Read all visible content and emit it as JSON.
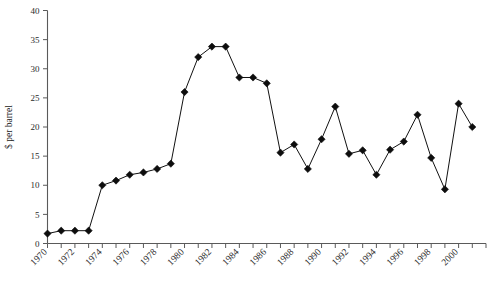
{
  "chart_data": {
    "type": "line",
    "title": "",
    "xlabel": "",
    "ylabel": "$ per barrel",
    "xlim": [
      1970,
      2002
    ],
    "ylim": [
      0,
      40
    ],
    "ytick_step": 5,
    "yticks": [
      0,
      5,
      10,
      15,
      20,
      25,
      30,
      35,
      40
    ],
    "ytick_labels": [
      "0",
      "5",
      "10",
      "15",
      "20",
      "25",
      "30",
      "35",
      "40"
    ],
    "xticks": [
      1970,
      1971,
      1972,
      1973,
      1974,
      1975,
      1976,
      1977,
      1978,
      1979,
      1980,
      1981,
      1982,
      1983,
      1984,
      1985,
      1986,
      1987,
      1988,
      1989,
      1990,
      1991,
      1992,
      1993,
      1994,
      1995,
      1996,
      1997,
      1998,
      1999,
      2000,
      2001,
      2002
    ],
    "xtick_labels_shown": [
      "1970",
      "1972",
      "1974",
      "1976",
      "1978",
      "1980",
      "1982",
      "1984",
      "1986",
      "1988",
      "1990",
      "1992",
      "1994",
      "1996",
      "1998",
      "2000"
    ],
    "xtick_label_interval": 2,
    "grid": false,
    "legend": false,
    "marker": "diamond",
    "line_color": "#111111",
    "marker_color": "#0d0d0d",
    "axis_color": "#5a5a5a",
    "x": [
      1970,
      1971,
      1972,
      1973,
      1974,
      1975,
      1976,
      1977,
      1978,
      1979,
      1980,
      1981,
      1982,
      1983,
      1984,
      1985,
      1986,
      1987,
      1988,
      1989,
      1990,
      1991,
      1992,
      1993,
      1994,
      1995,
      1996,
      1997,
      1998,
      1999,
      2000,
      2001
    ],
    "values": [
      1.7,
      2.2,
      2.2,
      2.2,
      10.0,
      10.8,
      11.8,
      12.2,
      12.8,
      13.7,
      26.0,
      32.0,
      33.8,
      33.8,
      28.5,
      28.5,
      27.5,
      15.6,
      17.0,
      12.8,
      17.9,
      23.5,
      15.4,
      16.0,
      11.8,
      16.1,
      17.5,
      22.1,
      14.7,
      9.3,
      24.0,
      20.0
    ],
    "series": [
      {
        "name": "Crude oil price",
        "values": [
          1.7,
          2.2,
          2.2,
          2.2,
          10.0,
          10.8,
          11.8,
          12.2,
          12.8,
          13.7,
          26.0,
          32.0,
          33.8,
          33.8,
          28.5,
          28.5,
          27.5,
          15.6,
          17.0,
          12.8,
          17.9,
          23.5,
          15.4,
          16.0,
          11.8,
          16.1,
          17.5,
          22.1,
          14.7,
          9.3,
          24.0,
          20.0
        ]
      }
    ]
  }
}
